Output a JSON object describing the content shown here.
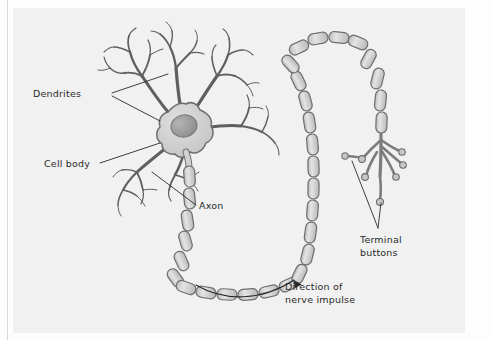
{
  "figure": {
    "background_color": "#f1f1f1",
    "page_color": "#fdfdfd",
    "ink_color": "#2a2a2a",
    "cell_fill_color": "#cfcfcf",
    "cell_outline_color": "#6e6e6e",
    "nucleus_color": "#9a9a9a",
    "myelin_fill_color": "#d4d4d4"
  },
  "labels": {
    "dendrites": "Dendrites",
    "cell_body": "Cell body",
    "axon": "Axon",
    "terminal_buttons_line1": "Terminal",
    "terminal_buttons_line2": "buttons",
    "direction_line1": "Direction of",
    "direction_line2": "nerve impulse"
  },
  "parts": [
    {
      "name": "dendrites",
      "label": "Dendrites",
      "count": 6
    },
    {
      "name": "cell-body",
      "label": "Cell body",
      "count": 1
    },
    {
      "name": "axon",
      "label": "Axon",
      "count": 1
    },
    {
      "name": "myelin-segments",
      "label": "Myelin sheath segments",
      "count": 22
    },
    {
      "name": "terminal-buttons",
      "label": "Terminal buttons",
      "count": 7
    }
  ],
  "annotations": {
    "impulse_direction": "Direction of nerve impulse",
    "arrow_points": "toward terminal buttons"
  }
}
